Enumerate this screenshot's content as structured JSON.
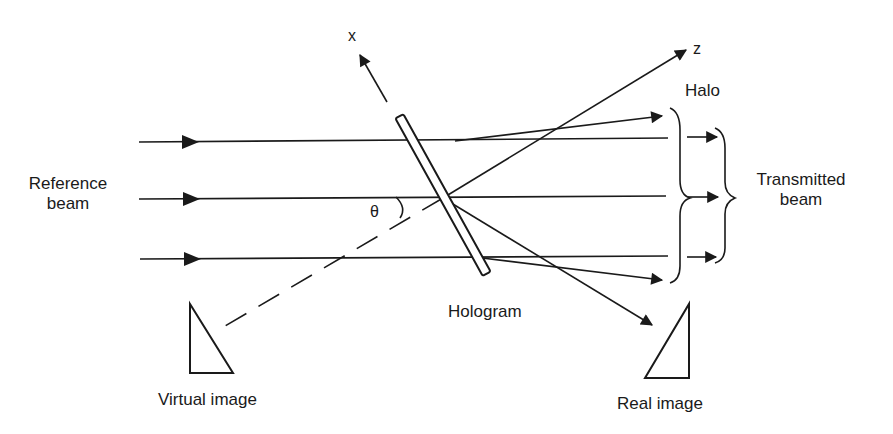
{
  "diagram": {
    "axes": {
      "x_label": "x",
      "z_label": "z",
      "angle_label": "θ"
    },
    "labels": {
      "reference_beam_line1": "Reference",
      "reference_beam_line2": "beam",
      "halo": "Halo",
      "transmitted_line1": "Transmitted",
      "transmitted_line2": "beam",
      "hologram": "Hologram",
      "virtual_image": "Virtual image",
      "real_image": "Real image"
    },
    "colors": {
      "ink": "#1a1a1a",
      "background": "#ffffff"
    }
  }
}
